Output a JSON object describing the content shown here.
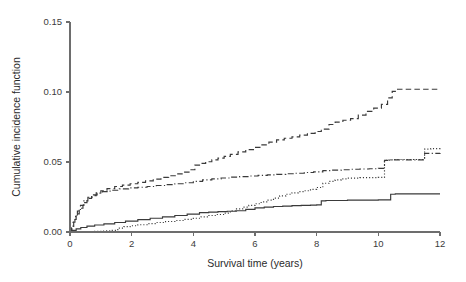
{
  "chart_data": {
    "type": "line",
    "title": "",
    "subtitle": "",
    "xlabel": "Survival time (years)",
    "ylabel": "Cumulative incidence function",
    "xlim": [
      0,
      12
    ],
    "ylim": [
      0,
      0.15
    ],
    "xticks": [
      0,
      2,
      4,
      6,
      8,
      10,
      12
    ],
    "xtick_labels": [
      "0",
      "2",
      "4",
      "6",
      "8",
      "10",
      "12"
    ],
    "yticks": [
      0.0,
      0.05,
      0.1,
      0.15
    ],
    "ytick_labels": [
      "0.00",
      "0.05",
      "0.10",
      "0.15"
    ],
    "grid": false,
    "legend": "none",
    "step_type": "post",
    "line_color": "#3a3a3a",
    "axis_color": "#6d6d6d",
    "background": "#ffffff",
    "annotations": [],
    "series": [
      {
        "name": "curve-dashed",
        "linestyle": "dashed",
        "final_value": 0.102,
        "x": [
          0,
          0.06,
          0.12,
          0.2,
          0.3,
          0.42,
          0.55,
          0.7,
          0.85,
          1.0,
          1.2,
          1.45,
          1.7,
          1.95,
          2.2,
          2.45,
          2.7,
          2.95,
          3.2,
          3.45,
          3.7,
          3.9,
          4.05,
          4.2,
          4.4,
          4.6,
          4.8,
          5.0,
          5.2,
          5.45,
          5.7,
          5.95,
          6.2,
          6.45,
          6.7,
          6.95,
          7.2,
          7.45,
          7.7,
          7.95,
          8.15,
          8.4,
          8.6,
          8.85,
          9.1,
          9.35,
          9.6,
          9.85,
          10.1,
          10.3,
          10.45,
          10.6,
          12
        ],
        "y": [
          0.0,
          0.004,
          0.009,
          0.013,
          0.017,
          0.021,
          0.024,
          0.026,
          0.028,
          0.0295,
          0.031,
          0.0325,
          0.0335,
          0.0345,
          0.0355,
          0.0365,
          0.0378,
          0.039,
          0.0402,
          0.0415,
          0.0428,
          0.0445,
          0.0478,
          0.049,
          0.0502,
          0.0515,
          0.0528,
          0.054,
          0.0555,
          0.0572,
          0.0588,
          0.0605,
          0.0622,
          0.0642,
          0.0658,
          0.067,
          0.068,
          0.0692,
          0.0705,
          0.0718,
          0.0735,
          0.0768,
          0.0785,
          0.0798,
          0.081,
          0.0835,
          0.0862,
          0.0885,
          0.0912,
          0.0958,
          0.1005,
          0.102,
          0.102
        ]
      },
      {
        "name": "curve-dashdot",
        "linestyle": "dashdot",
        "final_value": 0.0565,
        "x": [
          0,
          0.05,
          0.1,
          0.16,
          0.24,
          0.34,
          0.45,
          0.58,
          0.72,
          0.88,
          1.05,
          1.3,
          1.6,
          1.9,
          2.2,
          2.5,
          2.8,
          3.1,
          3.4,
          3.7,
          4.0,
          4.3,
          4.6,
          4.9,
          5.2,
          5.5,
          5.8,
          6.1,
          6.4,
          6.7,
          7.0,
          7.3,
          7.6,
          7.9,
          8.2,
          8.5,
          8.8,
          9.1,
          9.4,
          9.7,
          10.0,
          10.2,
          10.35,
          11.3,
          11.5,
          12
        ],
        "y": [
          0.0,
          0.003,
          0.007,
          0.011,
          0.015,
          0.019,
          0.0222,
          0.0248,
          0.0265,
          0.0278,
          0.0288,
          0.0298,
          0.0308,
          0.0315,
          0.032,
          0.0325,
          0.0332,
          0.0338,
          0.0345,
          0.0352,
          0.0362,
          0.0372,
          0.038,
          0.0386,
          0.0392,
          0.0396,
          0.04,
          0.0404,
          0.0408,
          0.0412,
          0.0416,
          0.042,
          0.0425,
          0.043,
          0.0438,
          0.0442,
          0.0445,
          0.0448,
          0.045,
          0.0452,
          0.0455,
          0.0512,
          0.0515,
          0.0515,
          0.0562,
          0.0565
        ]
      },
      {
        "name": "curve-dotted",
        "linestyle": "dotted",
        "final_value": 0.0598,
        "x": [
          0,
          0.4,
          0.8,
          1.1,
          1.35,
          1.55,
          1.75,
          1.95,
          2.2,
          2.5,
          2.8,
          3.1,
          3.4,
          3.7,
          4.0,
          4.25,
          4.5,
          4.75,
          5.0,
          5.2,
          5.4,
          5.6,
          5.8,
          6.0,
          6.2,
          6.4,
          6.6,
          6.8,
          7.0,
          7.2,
          7.4,
          7.6,
          7.8,
          8.0,
          8.2,
          8.4,
          8.6,
          8.8,
          9.0,
          9.4,
          10.0,
          10.2,
          10.35,
          10.5,
          11.3,
          11.5,
          11.7,
          12
        ],
        "y": [
          0.0,
          0.0002,
          0.0005,
          0.0008,
          0.0012,
          0.0028,
          0.0038,
          0.0045,
          0.0052,
          0.006,
          0.0068,
          0.0075,
          0.0082,
          0.009,
          0.0098,
          0.0108,
          0.0118,
          0.0125,
          0.0135,
          0.0152,
          0.0165,
          0.0178,
          0.019,
          0.0202,
          0.0215,
          0.0228,
          0.0242,
          0.0258,
          0.027,
          0.028,
          0.0288,
          0.0295,
          0.0305,
          0.0318,
          0.0348,
          0.0362,
          0.0372,
          0.038,
          0.0385,
          0.0388,
          0.039,
          0.0512,
          0.0515,
          0.0518,
          0.0518,
          0.0592,
          0.0596,
          0.0598
        ]
      },
      {
        "name": "curve-solid",
        "linestyle": "solid",
        "final_value": 0.0272,
        "x": [
          0,
          0.08,
          0.2,
          0.35,
          0.55,
          0.8,
          1.1,
          1.45,
          1.8,
          2.2,
          2.6,
          3.0,
          3.4,
          3.8,
          4.2,
          4.5,
          4.8,
          5.1,
          5.4,
          5.7,
          6.0,
          6.3,
          6.6,
          6.9,
          7.2,
          7.5,
          7.8,
          8.0,
          8.15,
          8.3,
          9.0,
          10.0,
          10.4,
          10.55,
          11.0,
          12
        ],
        "y": [
          0.0,
          0.0012,
          0.0022,
          0.0032,
          0.0042,
          0.005,
          0.0058,
          0.0068,
          0.0078,
          0.0088,
          0.0098,
          0.0108,
          0.0118,
          0.0128,
          0.0138,
          0.0142,
          0.0146,
          0.0148,
          0.0152,
          0.0162,
          0.0172,
          0.0178,
          0.0182,
          0.0185,
          0.0188,
          0.019,
          0.0192,
          0.0194,
          0.0222,
          0.0225,
          0.0228,
          0.023,
          0.027,
          0.0272,
          0.0272,
          0.0272
        ]
      }
    ]
  },
  "axes": {
    "xlabel": "Survival time (years)",
    "ylabel": "Cumulative incidence function",
    "xtick_labels": [
      "0",
      "2",
      "4",
      "6",
      "8",
      "10",
      "12"
    ],
    "ytick_labels": [
      "0.00",
      "0.05",
      "0.10",
      "0.15"
    ]
  }
}
